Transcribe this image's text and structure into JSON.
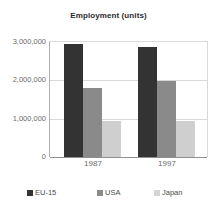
{
  "chart_data": {
    "type": "bar",
    "title": "Employment (units)",
    "xlabel": "",
    "ylabel": "",
    "categories": [
      "1987",
      "1997"
    ],
    "series": [
      {
        "name": "EU-15",
        "color": "#333333",
        "values": [
          2950000,
          2860000
        ]
      },
      {
        "name": "USA",
        "color": "#8a8a8a",
        "values": [
          1800000,
          1970000
        ]
      },
      {
        "name": "Japan",
        "color": "#cfcfcf",
        "values": [
          930000,
          930000
        ]
      }
    ],
    "ylim": [
      0,
      3000000
    ],
    "ytick_labels": [
      "0",
      "1,000,000",
      "2,000,000",
      "3,000,000"
    ],
    "ytick_values": [
      0,
      1000000,
      2000000,
      3000000
    ],
    "grid": true,
    "legend_position": "bottom"
  },
  "legend": {
    "items": [
      {
        "label": "EU-15"
      },
      {
        "label": "USA"
      },
      {
        "label": "Japan"
      }
    ]
  }
}
